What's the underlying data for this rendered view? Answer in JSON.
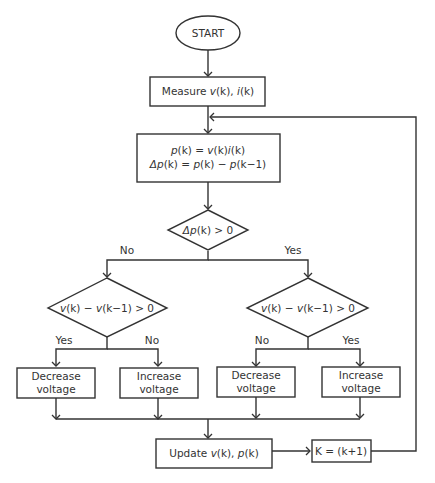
{
  "diagram": {
    "type": "flowchart",
    "colors": {
      "stroke": "#333333",
      "text": "#333333",
      "background": "#ffffff"
    },
    "nodes": {
      "start": {
        "shape": "ellipse",
        "label": "START"
      },
      "measure": {
        "shape": "rect",
        "label_prefix": "Measure ",
        "v": "v",
        "k1": "(k), ",
        "i": "i",
        "k2": "(k)"
      },
      "compute": {
        "shape": "rect",
        "line1": {
          "p": "p",
          "a": "(k) = ",
          "v": "v",
          "b": "(k)",
          "i": "i",
          "c": "(k)"
        },
        "line2": {
          "dp": "Δp",
          "a": "(k) = ",
          "p1": "p",
          "b": "(k) − ",
          "p2": "p",
          "c": "(k−1)"
        }
      },
      "decision_dp": {
        "shape": "diamond",
        "dp": "Δp",
        "rest": "(k) > 0"
      },
      "decision_dv_left": {
        "shape": "diamond",
        "v1": "v",
        "a": "(k) − ",
        "v2": "v",
        "b": "(k−1) > 0"
      },
      "decision_dv_right": {
        "shape": "diamond",
        "v1": "v",
        "a": "(k) − ",
        "v2": "v",
        "b": "(k−1) > 0"
      },
      "action_1": {
        "shape": "rect",
        "line1": "Decrease",
        "line2": "voltage"
      },
      "action_2": {
        "shape": "rect",
        "line1": "Increase",
        "line2": "voltage"
      },
      "action_3": {
        "shape": "rect",
        "line1": "Decrease",
        "line2": "voltage"
      },
      "action_4": {
        "shape": "rect",
        "line1": "Increase",
        "line2": "voltage"
      },
      "update": {
        "shape": "rect",
        "prefix": "Update ",
        "v": "v",
        "a": "(k), ",
        "p": "p",
        "b": "(k)"
      },
      "increment": {
        "shape": "rect",
        "label": "K = (k+1)"
      }
    },
    "edge_labels": {
      "dp_no": "No",
      "dp_yes": "Yes",
      "left_yes": "Yes",
      "left_no": "No",
      "right_no": "No",
      "right_yes": "Yes"
    },
    "edges": [
      [
        "start",
        "measure"
      ],
      [
        "measure",
        "compute"
      ],
      [
        "compute",
        "decision_dp"
      ],
      [
        "decision_dp",
        "decision_dv_left",
        "No"
      ],
      [
        "decision_dp",
        "decision_dv_right",
        "Yes"
      ],
      [
        "decision_dv_left",
        "action_1",
        "Yes"
      ],
      [
        "decision_dv_left",
        "action_2",
        "No"
      ],
      [
        "decision_dv_right",
        "action_3",
        "No"
      ],
      [
        "decision_dv_right",
        "action_4",
        "Yes"
      ],
      [
        "action_1",
        "update"
      ],
      [
        "action_2",
        "update"
      ],
      [
        "action_3",
        "update"
      ],
      [
        "action_4",
        "update"
      ],
      [
        "update",
        "increment"
      ],
      [
        "increment",
        "compute"
      ]
    ]
  }
}
